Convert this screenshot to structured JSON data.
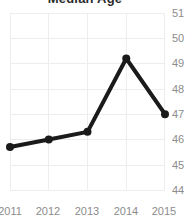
{
  "chart_data": {
    "type": "line",
    "title": "Median Age",
    "title_clipped": true,
    "xlabel": "",
    "ylabel": "",
    "categories": [
      "2011",
      "2012",
      "2013",
      "2014",
      "2015"
    ],
    "x": [
      2011,
      2012,
      2013,
      2014,
      2015
    ],
    "values": [
      45.7,
      46.0,
      46.3,
      49.2,
      47.0
    ],
    "series": [
      {
        "name": "Median Age",
        "values": [
          45.7,
          46.0,
          46.3,
          49.2,
          47.0
        ]
      }
    ],
    "ylim": [
      44,
      51
    ],
    "yticks": [
      44,
      45,
      46,
      47,
      48,
      49,
      50,
      51
    ],
    "ytick_labels": [
      "44",
      "45",
      "46",
      "47",
      "48",
      "49",
      "50",
      "51"
    ],
    "xtick_labels": [
      "2011",
      "2012",
      "2013",
      "2014",
      "2015"
    ],
    "grid": true,
    "grid_color": "#ededed",
    "legend": false,
    "legend_position": "none",
    "line_color": "#1a1a1a",
    "marker": "circle",
    "marker_color": "#1a1a1a",
    "tick_label_color": "#8c8c8c",
    "background_color": "#ffffff",
    "y_axis_position": "right"
  }
}
